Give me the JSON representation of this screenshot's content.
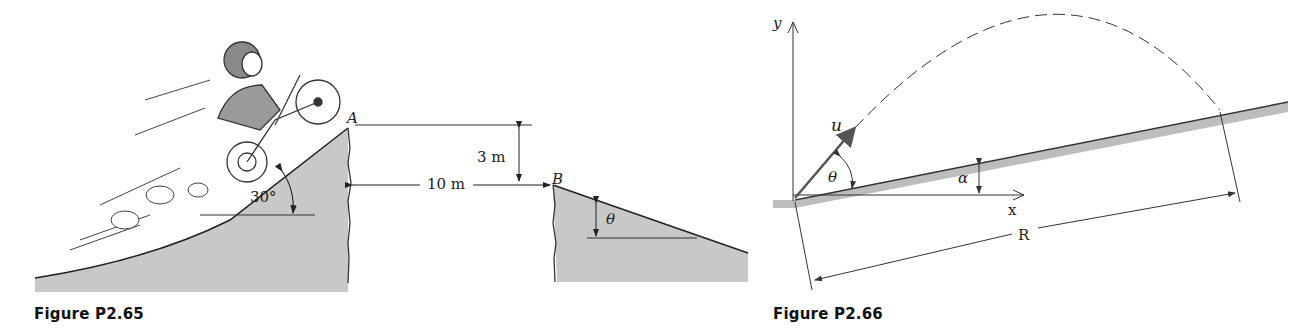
{
  "figures": [
    {
      "id": "P2.65",
      "caption": "Figure P2.65",
      "labels": {
        "point_a": "A",
        "point_b": "B",
        "height": "3 m",
        "gap": "10 m",
        "ramp_angle": "30°",
        "landing_angle": "θ"
      },
      "colors": {
        "ground_fill": "#c8c8c8",
        "line": "#222222"
      }
    },
    {
      "id": "P2.66",
      "caption": "Figure P2.66",
      "labels": {
        "y_axis": "y",
        "x_axis": "x",
        "velocity": "u",
        "launch_angle": "θ",
        "incline_angle": "α",
        "range": "R"
      },
      "colors": {
        "incline_fill": "#bdbdbd",
        "line": "#333333",
        "velocity_vector": "#555555"
      }
    }
  ]
}
